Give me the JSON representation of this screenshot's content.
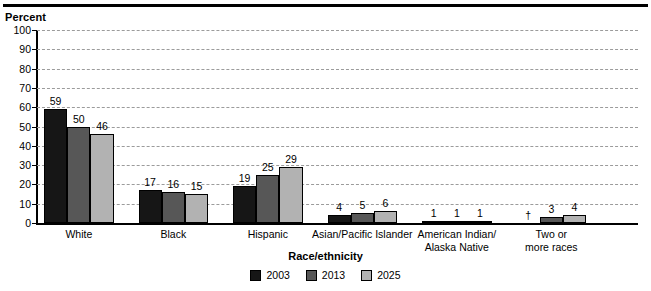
{
  "chart_data": {
    "type": "bar",
    "title": "",
    "ylabel": "Percent",
    "xlabel": "Race/ethnicity",
    "ylim": [
      0,
      100
    ],
    "yticks": [
      0,
      10,
      20,
      30,
      40,
      50,
      60,
      70,
      80,
      90,
      100
    ],
    "grid": true,
    "legend_position": "bottom",
    "categories": [
      "White",
      "Black",
      "Hispanic",
      "Asian/Pacific Islander",
      "American Indian/\nAlaska Native",
      "Two or\nmore races"
    ],
    "series": [
      {
        "name": "2003",
        "color": "#161616",
        "values": [
          59,
          17,
          19,
          4,
          1,
          null
        ],
        "labels": [
          "59",
          "17",
          "19",
          "4",
          "1",
          "†"
        ]
      },
      {
        "name": "2013",
        "color": "#575757",
        "values": [
          50,
          16,
          25,
          5,
          1,
          3
        ],
        "labels": [
          "50",
          "16",
          "25",
          "5",
          "1",
          "3"
        ]
      },
      {
        "name": "2025",
        "color": "#b2b2b2",
        "values": [
          46,
          15,
          29,
          6,
          1,
          4
        ],
        "labels": [
          "46",
          "15",
          "29",
          "6",
          "1",
          "4"
        ]
      }
    ]
  },
  "axis": {
    "y_title": "Percent",
    "x_title": "Race/ethnicity"
  },
  "legend": {
    "items": [
      {
        "label": "2003",
        "color": "#161616"
      },
      {
        "label": "2013",
        "color": "#575757"
      },
      {
        "label": "2025",
        "color": "#b2b2b2"
      }
    ]
  },
  "colors": {
    "axis": "#000000",
    "gridline": "#9b9b9b",
    "background": "#ffffff",
    "series_2003": "#161616",
    "series_2013": "#575757",
    "series_2025": "#b2b2b2"
  }
}
